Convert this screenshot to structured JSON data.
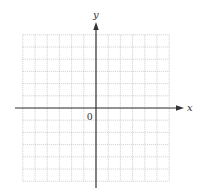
{
  "diagram": {
    "type": "coordinate-plane",
    "x_axis_label": "x",
    "y_axis_label": "y",
    "origin_label": "0",
    "grid": {
      "columns": 12,
      "rows": 12,
      "columns_left_of_origin": 6,
      "rows_above_origin": 6,
      "style": "dotted"
    },
    "colors": {
      "grid": "#b8b8b8",
      "axis": "#333333",
      "background": "#ffffff"
    }
  }
}
